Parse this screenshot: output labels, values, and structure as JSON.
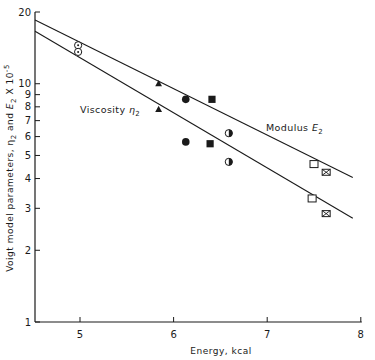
{
  "chart_data": {
    "type": "scatter",
    "title": "",
    "xlabel": "Energy, kcal",
    "ylabel": "Voigt model parameters, η2 and E2 X 10^-5",
    "ylabel_parts": {
      "main": "Voigt model parameters, η",
      "sub1": "2",
      "mid": " and ",
      "E": "E",
      "sub2": "2",
      "tail": " X 10",
      "sup": "-5"
    },
    "xlim": [
      4.52,
      8.0
    ],
    "ylim": [
      1,
      20
    ],
    "yscale": "log",
    "grid": false,
    "legend": "none (inline labels)",
    "x_ticks": [
      5,
      6,
      7,
      8
    ],
    "x_tick_labels": [
      "5",
      "6",
      "7",
      "8"
    ],
    "y_ticks": [
      1,
      2,
      3,
      4,
      5,
      6,
      7,
      8,
      9,
      10,
      20
    ],
    "y_tick_labels": [
      "1",
      "2",
      "3",
      "4",
      "5",
      "6",
      "7",
      "8",
      "9",
      "10",
      "20"
    ],
    "series": [
      {
        "name": "Modulus E2",
        "label_main": "Modulus ",
        "label_sym": "E",
        "label_sub": "2",
        "fit_line": [
          [
            4.52,
            18.5
          ],
          [
            8.0,
            4.0
          ]
        ],
        "points": [
          {
            "x": 4.98,
            "y": 14.5,
            "marker": "circle-dot"
          },
          {
            "x": 5.84,
            "y": 10.0,
            "marker": "triangle-filled"
          },
          {
            "x": 6.13,
            "y": 8.6,
            "marker": "circle-filled"
          },
          {
            "x": 6.41,
            "y": 8.6,
            "marker": "square-filled"
          },
          {
            "x": 6.59,
            "y": 6.2,
            "marker": "circle-half"
          },
          {
            "x": 7.5,
            "y": 4.6,
            "marker": "square-open"
          },
          {
            "x": 7.63,
            "y": 4.25,
            "marker": "square-x"
          }
        ]
      },
      {
        "name": "Viscosity η2",
        "label_main": "Viscosity ",
        "label_sym": "η",
        "label_sub": "2",
        "fit_line": [
          [
            4.52,
            16.6
          ],
          [
            8.0,
            2.7
          ]
        ],
        "points": [
          {
            "x": 4.98,
            "y": 13.6,
            "marker": "circle-dot"
          },
          {
            "x": 5.84,
            "y": 7.8,
            "marker": "triangle-filled"
          },
          {
            "x": 6.13,
            "y": 5.7,
            "marker": "circle-filled"
          },
          {
            "x": 6.39,
            "y": 5.6,
            "marker": "square-filled"
          },
          {
            "x": 6.59,
            "y": 4.7,
            "marker": "circle-half"
          },
          {
            "x": 7.48,
            "y": 3.3,
            "marker": "square-open"
          },
          {
            "x": 7.63,
            "y": 2.85,
            "marker": "square-x"
          }
        ]
      }
    ]
  }
}
